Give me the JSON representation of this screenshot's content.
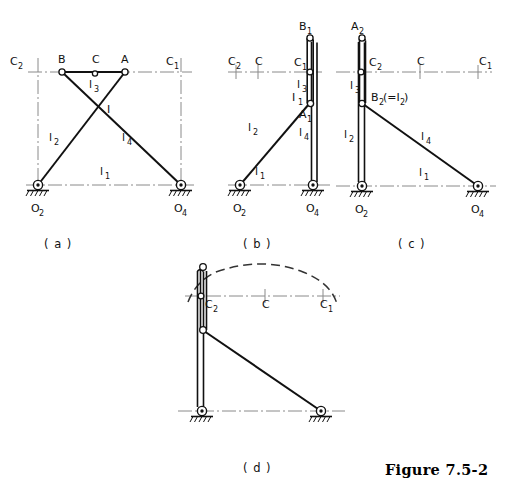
{
  "figure": {
    "caption": "Figure 7.5-2",
    "subcaptions": [
      {
        "id": "a",
        "text": "( a )"
      },
      {
        "id": "b",
        "text": "( b )"
      },
      {
        "id": "c",
        "text": "( c )"
      },
      {
        "id": "d",
        "text": "( d )"
      }
    ]
  },
  "colors": {
    "line": "#111111",
    "centerline": "#8a8a8a",
    "dashed_arc": "#333333",
    "joint_fill": "#ffffff",
    "background": "#ffffff"
  },
  "diagram_a": {
    "name": "crossed-four-bar-linkage",
    "labels": {
      "C2_left": "C",
      "C2_left_sub": "2",
      "B": "B",
      "C_top": "C",
      "A": "A",
      "C1_right": "C",
      "C1_right_sub": "1",
      "l3": "l",
      "l3_sub": "3",
      "I": "I",
      "l2": "l",
      "l2_sub": "2",
      "l4": "l",
      "l4_sub": "4",
      "l1": "l",
      "l1_sub": "1",
      "O2": "O",
      "O2_sub": "2",
      "O4": "O",
      "O4_sub": "4"
    }
  },
  "diagram_b": {
    "name": "folded-position-1",
    "labels": {
      "B1": "B",
      "B1_sub": "1",
      "C2_left": "C",
      "C2_left_sub": "2",
      "C_mid": "C",
      "C1": "C",
      "C1_sub": "1",
      "l3": "l",
      "l3_sub": "3",
      "I1": "I",
      "I1_sub": "1",
      "A1": "A",
      "A1_sub": "1",
      "l2": "l",
      "l2_sub": "2",
      "l4": "l",
      "l4_sub": "4",
      "l1": "l",
      "l1_sub": "1",
      "O2": "O",
      "O2_sub": "2",
      "O4": "O",
      "O4_sub": "4"
    }
  },
  "diagram_c": {
    "name": "folded-position-2",
    "labels": {
      "A2": "A",
      "A2_sub": "2",
      "C2": "C",
      "C2_sub": "2",
      "C_mid": "C",
      "C1": "C",
      "C1_sub": "1",
      "l3": "l",
      "l3_sub": "3",
      "B2": "B",
      "B2_sub": "2",
      "B2_paren": "(=I",
      "B2_paren_sub": "2",
      "B2_paren_close": ")",
      "l2": "l",
      "l2_sub": "2",
      "l4": "l",
      "l4_sub": "4",
      "l1": "l",
      "l1_sub": "1",
      "O2": "O",
      "O2_sub": "2",
      "O4": "O",
      "O4_sub": "4"
    }
  },
  "diagram_d": {
    "name": "coupler-curve-arc",
    "labels": {
      "C2": "C",
      "C2_sub": "2",
      "C_mid": "C",
      "C1": "C",
      "C1_sub": "1"
    }
  }
}
